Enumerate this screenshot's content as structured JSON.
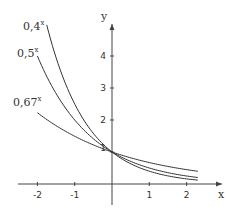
{
  "chart_data": {
    "type": "line",
    "title": "",
    "xlabel": "x",
    "ylabel": "y",
    "xlim": [
      -2.1,
      2.4
    ],
    "ylim": [
      0,
      5
    ],
    "grid": false,
    "x_ticks": [
      "-2",
      "-1",
      "1",
      "2"
    ],
    "x_tick_values": [
      -2,
      -1,
      1,
      2
    ],
    "y_ticks": [
      "1",
      "2",
      "3",
      "4"
    ],
    "y_tick_values": [
      1,
      2,
      3,
      4
    ],
    "series": [
      {
        "name": "0,4^x",
        "label": "0,4",
        "exponent": "x",
        "base": 0.4,
        "x_range": [
          -1.75,
          2.3
        ]
      },
      {
        "name": "0,5^x",
        "label": "0,5",
        "exponent": "x",
        "base": 0.5,
        "x_range": [
          -2.0,
          2.3
        ]
      },
      {
        "name": "0,67^x",
        "label": "0,67",
        "exponent": "x",
        "base": 0.67,
        "x_range": [
          -2.0,
          2.3
        ]
      }
    ],
    "annotations": [
      "0,4^x",
      "0,5^x",
      "0,67^x"
    ],
    "legend_position": "inline-left"
  },
  "axes": {
    "x_label": "x",
    "y_label": "y"
  },
  "labels": {
    "l04": {
      "base": "0,4",
      "exp": "x"
    },
    "l05": {
      "base": "0,5",
      "exp": "x"
    },
    "l067": {
      "base": "0,67",
      "exp": "x"
    }
  }
}
